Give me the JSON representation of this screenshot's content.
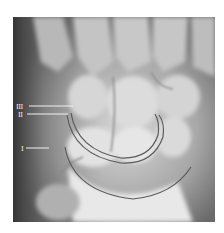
{
  "figure": {
    "arcs": [
      {
        "id": "I",
        "label": "I"
      },
      {
        "id": "II",
        "label": "II"
      },
      {
        "id": "III",
        "label": "III"
      }
    ],
    "colors": {
      "background": "#ffffff",
      "film_dark": "#3a3a3a",
      "bone_light": "#e6e6e6",
      "arc_line": "#5a5a5a",
      "label_text": "#f2f2f2"
    }
  }
}
